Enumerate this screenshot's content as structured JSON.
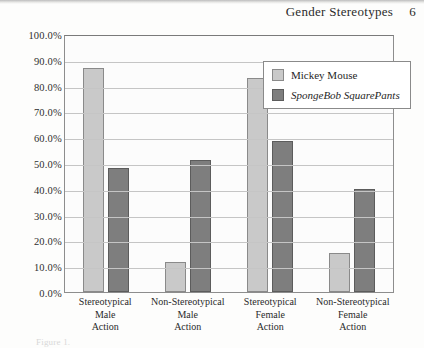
{
  "header": {
    "running_title": "Gender Stereotypes",
    "page_number": "6"
  },
  "caption_remnant": "Figure 1.",
  "legend": {
    "items": [
      {
        "label": "Mickey Mouse",
        "color": "#c9c9c9",
        "italic": false
      },
      {
        "label": "SpongeBob SquarePants",
        "color": "#7e7e7e",
        "italic": true
      }
    ]
  },
  "chart_data": {
    "type": "bar",
    "title": "",
    "xlabel": "",
    "ylabel": "",
    "ylim": [
      0,
      100
    ],
    "grid": true,
    "legend_position": "top-right-inside",
    "y_ticks": [
      "0.0%",
      "10.0%",
      "20.0%",
      "30.0%",
      "40.0%",
      "50.0%",
      "60.0%",
      "70.0%",
      "80.0%",
      "90.0%",
      "100.0%"
    ],
    "y_tick_values": [
      0,
      10,
      20,
      30,
      40,
      50,
      60,
      70,
      80,
      90,
      100
    ],
    "categories": [
      "Stereotypical Male Action",
      "Non-Stereotypical Male Action",
      "Stereotypical Female Action",
      "Non-Stereotypical Female Action"
    ],
    "category_lines": [
      [
        "Stereotypical",
        "Male",
        "Action"
      ],
      [
        "Non-Stereotypical",
        "Male",
        "Action"
      ],
      [
        "Stereotypical",
        "Female",
        "Action"
      ],
      [
        "Non-Stereotypical",
        "Female",
        "Action"
      ]
    ],
    "series": [
      {
        "name": "Mickey Mouse",
        "color": "#c9c9c9",
        "values": [
          87.0,
          11.5,
          83.0,
          15.0
        ]
      },
      {
        "name": "SpongeBob SquarePants",
        "color": "#7e7e7e",
        "values": [
          48.0,
          51.0,
          58.5,
          40.0
        ]
      }
    ]
  }
}
